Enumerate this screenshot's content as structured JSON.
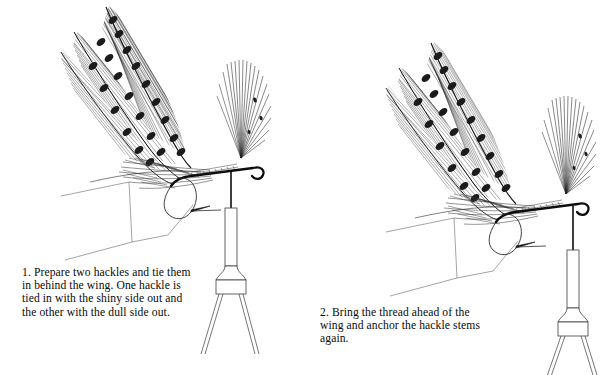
{
  "page": {
    "background": "#ffffff",
    "ink": "#000000",
    "width": 570,
    "height": 375
  },
  "figures": [
    {
      "id": "figure-1",
      "step_number": "1.",
      "caption": "1.  Prepare two hackles and tie them\nin behind the wing. One hackle is\ntied in with the shiny side out and\nthe other with the dull side out.",
      "parts": [
        "mottled-feather-wing",
        "hackle-fiber-fan",
        "hackle-stems",
        "hook",
        "hook-barb",
        "tying-thread",
        "bobbin"
      ]
    },
    {
      "id": "figure-2",
      "step_number": "2.",
      "caption": "2.  Bring the thread ahead of the\nwing and anchor the hackle stems\nagain.",
      "parts": [
        "mottled-feather-wing",
        "hackle-fiber-fan",
        "hackle-stems",
        "hook",
        "hook-barb",
        "tying-thread",
        "bobbin"
      ]
    }
  ]
}
